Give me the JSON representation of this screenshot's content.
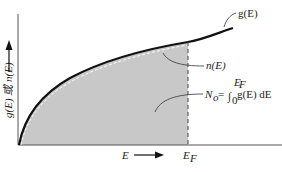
{
  "diagram": {
    "y_axis_label": "g(E) 或 n(E)",
    "x_axis_label": "E",
    "curves": [
      {
        "name": "g(E)",
        "label": "g(E)",
        "style": "solid-thick",
        "color": "#111111"
      },
      {
        "name": "n(E)",
        "label": "n(E)",
        "style": "dashed-white",
        "color": "#ffffff"
      }
    ],
    "shaded_region": {
      "label": "N_o = ∫_0^{E_F} g(E) dE",
      "fill": "#c8c8c8"
    },
    "fermi_level": {
      "label": "E_F",
      "style": "dashed"
    },
    "labels": {
      "g": "g(E)",
      "n": "n(E)",
      "No_prefix": "N",
      "No_sub": "o",
      "No_eq": " = ",
      "integral": "∫",
      "int_upper": "E",
      "int_upper_sub": "F",
      "int_lower": "0",
      "integrand": "g(E) dE",
      "E": "E",
      "EF_main": "E",
      "EF_sub": "F",
      "y_axis": "g(E) 或 n(E)"
    }
  }
}
